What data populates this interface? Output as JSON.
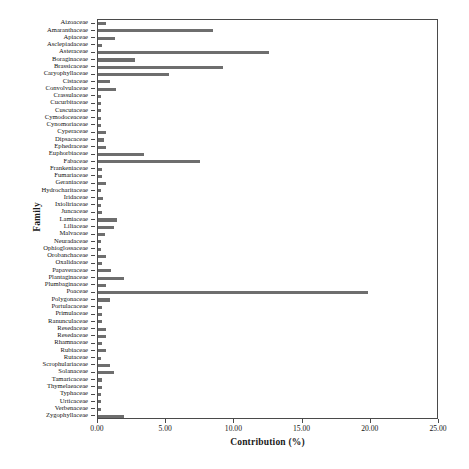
{
  "page": {
    "header_text": "",
    "header_number": "",
    "footer_text": ""
  },
  "chart_data": {
    "type": "bar",
    "orientation": "horizontal",
    "title": "",
    "xlabel": "Contribution (%)",
    "ylabel": "Family",
    "xlim": [
      0,
      25
    ],
    "xticks": [
      "0.00",
      "5.00",
      "10.00",
      "15.00",
      "20.00",
      "25.00"
    ],
    "xtick_values": [
      0,
      5,
      10,
      15,
      20,
      25
    ],
    "grid": false,
    "legend": false,
    "bar_color": "#6e6e6e",
    "axis_color": "#4a4a4a",
    "categories": [
      "Aizoaceae",
      "Amaranthaceae",
      "Apiaceae",
      "Asclepiadaceae",
      "Asteraceae",
      "Boraginaceae",
      "Brassicaceae",
      "Caryophyllaceae",
      "Cistaceae",
      "Convolvulaceae",
      "Crassulaceae",
      "Cucurbitaceae",
      "Cuscutaceae",
      "Cymodoceaceae",
      "Cynomoriaceae",
      "Cyperaceae",
      "Dipsacaceae",
      "Ephedraceae",
      "Euphorbiaceae",
      "Fabaceae",
      "Frankeniaceae",
      "Fumariaceae",
      "Geraniaceae",
      "Hydrocharitaceae",
      "Iridaceae",
      "Ixioliriaceae",
      "Juncaceae",
      "Lamiaceae",
      "Liliaceae",
      "Malvaceae",
      "Neuradaceae",
      "Ophioglossaceae",
      "Orobanchaceae",
      "Oxalidaceae",
      "Papaveraceae",
      "Plantaginaceae",
      "Plumbaginaceae",
      "Poaceae",
      "Polygonaceae",
      "Portulacaceae",
      "Primulaceae",
      "Ranunculaceae",
      "Resedaceae",
      "Resedaceae",
      "Rhamnaceae",
      "Rubiaceae",
      "Rutaceae",
      "Scrophulariaceae",
      "Solanaceae",
      "Tamaricaceae",
      "Thymelaeaceae",
      "Typhaceae",
      "Urticaceae",
      "Verbenaceae",
      "Zygophyllaceae"
    ],
    "values": [
      0.6,
      8.4,
      1.25,
      0.3,
      12.5,
      2.7,
      9.2,
      5.2,
      0.85,
      1.3,
      0.25,
      0.25,
      0.25,
      0.25,
      0.25,
      0.55,
      0.45,
      0.6,
      3.4,
      7.5,
      0.3,
      0.3,
      0.6,
      0.25,
      0.35,
      0.25,
      0.3,
      1.4,
      1.2,
      0.5,
      0.25,
      0.25,
      0.55,
      0.3,
      0.95,
      1.9,
      0.6,
      19.8,
      0.85,
      0.3,
      0.3,
      0.3,
      0.6,
      0.6,
      0.3,
      0.55,
      0.25,
      0.85,
      1.2,
      0.3,
      0.3,
      0.25,
      0.25,
      0.25,
      1.9
    ]
  }
}
